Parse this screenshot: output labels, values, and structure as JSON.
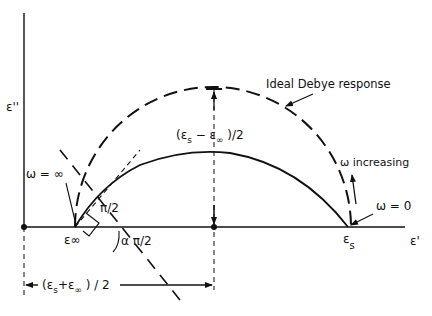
{
  "diagram": {
    "axes": {
      "y_label": "ε''",
      "x_label": "ε'"
    },
    "labels": {
      "ideal": "Ideal Debye response",
      "half_diff": "(εs − ε∞)/2",
      "omega_inf": "ω = ∞",
      "omega_zero": "ω = 0",
      "omega_increasing": "ω increasing",
      "right_angle": "π/2",
      "alpha_angle": "α π/2",
      "eps_inf": "ε∞",
      "eps_s_main": "ε",
      "eps_s_sub": "s",
      "half_sum": "(εs + ε∞)/2"
    },
    "points": {
      "eps_inf_x": 75,
      "center_x": 214,
      "eps_s_x": 348,
      "axis_y": 227,
      "ideal_top_y": 88,
      "arc_top_y": 153
    },
    "colors": {
      "ink": "#111111",
      "background": "#ffffff"
    }
  }
}
